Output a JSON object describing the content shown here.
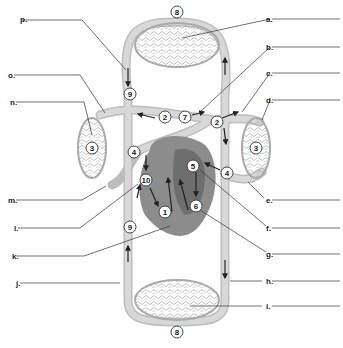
{
  "diagram": {
    "left_labels": [
      {
        "id": "p",
        "text": "p.",
        "x": 20,
        "y": 19
      },
      {
        "id": "o",
        "text": "o.",
        "x": 8,
        "y": 75
      },
      {
        "id": "n",
        "text": "n.",
        "x": 10,
        "y": 102
      },
      {
        "id": "m",
        "text": "m.",
        "x": 8,
        "y": 200
      },
      {
        "id": "l",
        "text": "l.",
        "x": 14,
        "y": 228
      },
      {
        "id": "k",
        "text": "k.",
        "x": 12,
        "y": 256
      },
      {
        "id": "j",
        "text": "j.",
        "x": 16,
        "y": 283
      }
    ],
    "right_labels": [
      {
        "id": "a",
        "text": "a.",
        "x": 266,
        "y": 19
      },
      {
        "id": "b",
        "text": "b.",
        "x": 266,
        "y": 47
      },
      {
        "id": "c",
        "text": "c.",
        "x": 266,
        "y": 73
      },
      {
        "id": "d",
        "text": "d.",
        "x": 266,
        "y": 100
      },
      {
        "id": "e",
        "text": "e.",
        "x": 266,
        "y": 200
      },
      {
        "id": "f",
        "text": "f.",
        "x": 266,
        "y": 228
      },
      {
        "id": "g",
        "text": "g.",
        "x": 266,
        "y": 254
      },
      {
        "id": "h",
        "text": "h.",
        "x": 266,
        "y": 281
      },
      {
        "id": "i",
        "text": "i.",
        "x": 266,
        "y": 306
      }
    ],
    "numbers": [
      {
        "n": "8",
        "x": 177,
        "y": 12
      },
      {
        "n": "9",
        "x": 130,
        "y": 94
      },
      {
        "n": "2",
        "x": 165,
        "y": 117
      },
      {
        "n": "7",
        "x": 185,
        "y": 117
      },
      {
        "n": "2",
        "x": 217,
        "y": 122
      },
      {
        "n": "3",
        "x": 92,
        "y": 148
      },
      {
        "n": "3",
        "x": 256,
        "y": 148
      },
      {
        "n": "4",
        "x": 134,
        "y": 152
      },
      {
        "n": "5",
        "x": 193,
        "y": 166
      },
      {
        "n": "4",
        "x": 227,
        "y": 173
      },
      {
        "n": "10",
        "x": 146,
        "y": 180
      },
      {
        "n": "6",
        "x": 196,
        "y": 206
      },
      {
        "n": "1",
        "x": 165,
        "y": 212
      },
      {
        "n": "9",
        "x": 130,
        "y": 227
      },
      {
        "n": "8",
        "x": 177,
        "y": 332
      }
    ]
  }
}
